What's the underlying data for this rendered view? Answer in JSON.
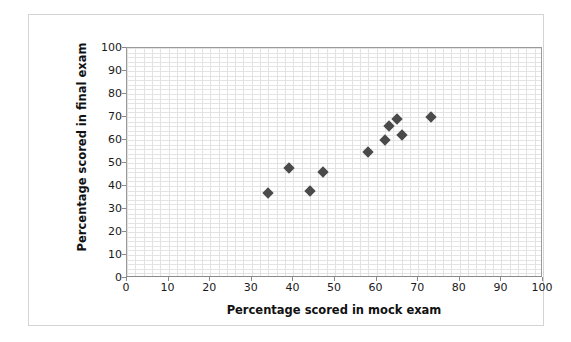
{
  "chart_data": {
    "type": "scatter",
    "title": "",
    "xlabel": "Percentage scored in mock exam",
    "ylabel": "Percentage scored in final exam",
    "xlim": [
      0,
      100
    ],
    "ylim": [
      0,
      100
    ],
    "xticks": [
      0,
      10,
      20,
      30,
      40,
      50,
      60,
      70,
      80,
      90,
      100
    ],
    "yticks": [
      0,
      10,
      20,
      30,
      40,
      50,
      60,
      70,
      80,
      90,
      100
    ],
    "x_minor_step": 2,
    "y_minor_step": 2,
    "grid": true,
    "legend": "none",
    "marker": "diamond",
    "marker_color": "#4a4a4a",
    "series": [
      {
        "name": "Students",
        "points": [
          {
            "x": 34,
            "y": 37
          },
          {
            "x": 39,
            "y": 48
          },
          {
            "x": 44,
            "y": 38
          },
          {
            "x": 47,
            "y": 46
          },
          {
            "x": 58,
            "y": 55
          },
          {
            "x": 62,
            "y": 60
          },
          {
            "x": 63,
            "y": 66
          },
          {
            "x": 65,
            "y": 69
          },
          {
            "x": 66,
            "y": 62
          },
          {
            "x": 73,
            "y": 70
          }
        ]
      }
    ]
  }
}
